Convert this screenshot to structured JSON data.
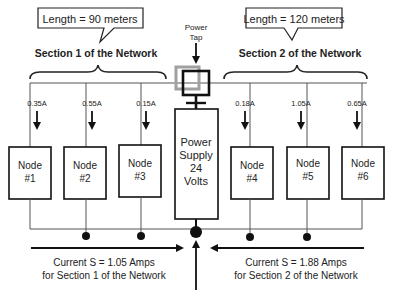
{
  "callouts": {
    "left": "Length = 90 meters",
    "right": "Length = 120 meters"
  },
  "sections": {
    "left": "Section 1 of the Network",
    "right": "Section 2 of the Network"
  },
  "power_tap": {
    "line1": "Power",
    "line2": "Tap"
  },
  "power_supply": {
    "line1": "Power",
    "line2": "Supply",
    "line3": "24",
    "line4": "Volts"
  },
  "nodes": [
    {
      "label": "Node",
      "number": "#1",
      "current": "0.35A"
    },
    {
      "label": "Node",
      "number": "#2",
      "current": "0.55A"
    },
    {
      "label": "Node",
      "number": "#3",
      "current": "0.15A"
    },
    {
      "label": "Node",
      "number": "#4",
      "current": "0.18A"
    },
    {
      "label": "Node",
      "number": "#5",
      "current": "1.05A"
    },
    {
      "label": "Node",
      "number": "#6",
      "current": "0.65A"
    }
  ],
  "currents": {
    "left_line1": "Current S = 1.05 Amps",
    "left_line2": "for Section 1 of the Network",
    "right_line1": "Current S = 1.88 Amps",
    "right_line2": "for Section 2 of the Network"
  },
  "colors": {
    "line": "#222222",
    "tap_gray": "#a0a0a0",
    "thin_line": "#555555"
  }
}
